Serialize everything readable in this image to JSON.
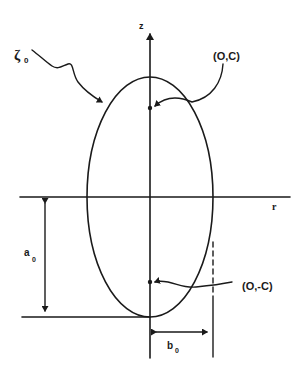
{
  "figure": {
    "type": "prolate-spheroid-cross-section",
    "axes": {
      "vertical_label": "z",
      "horizontal_label": "r"
    },
    "labels": {
      "surface": "ζ",
      "surface_subscript": "0",
      "focus_top": "(O,C)",
      "focus_bottom": "(O,-C)",
      "semi_major": "a",
      "semi_major_subscript": "0",
      "semi_minor": "b",
      "semi_minor_subscript": "0"
    },
    "colors": {
      "ink": "#1a1a1a",
      "background": "#ffffff"
    }
  }
}
